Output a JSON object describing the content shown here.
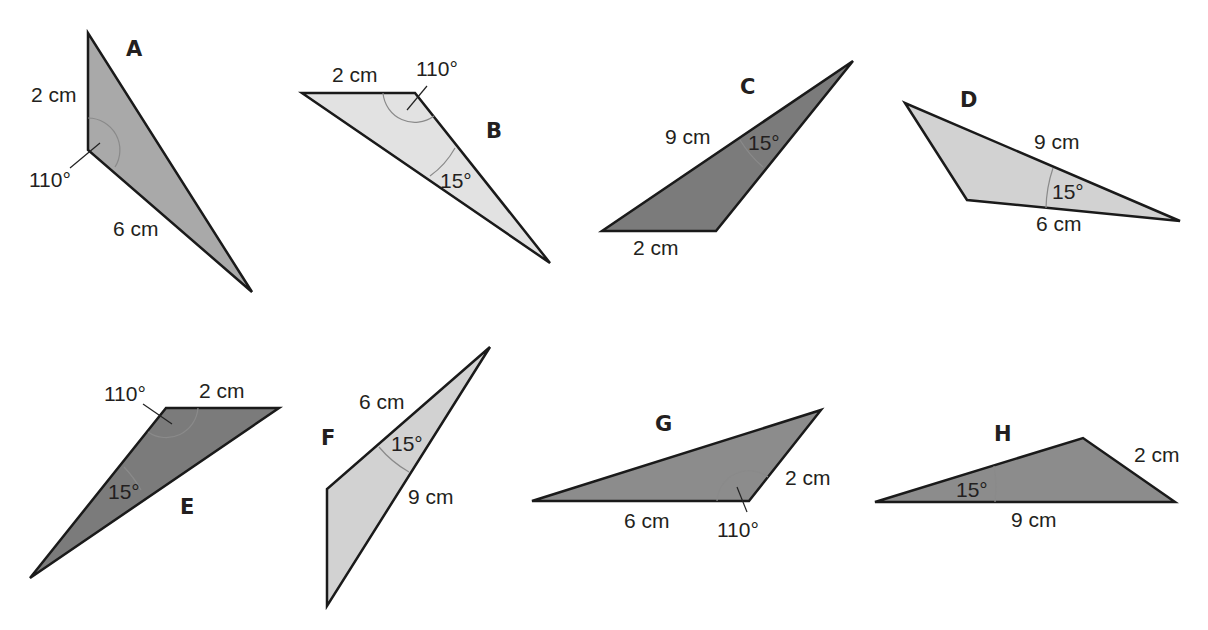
{
  "colors": {
    "stroke": "#1a1a1a",
    "medium_gray": "#a9a9a9",
    "light_gray": "#e2e2e2",
    "pale_gray": "#d2d2d2",
    "dark_gray": "#7b7b7b",
    "mid_dark_gray": "#8c8c8c",
    "text": "#231f20"
  },
  "triangles": [
    {
      "name": "A",
      "labels": {
        "side1": "2 cm",
        "side2": "6 cm",
        "angle": "110°"
      }
    },
    {
      "name": "B",
      "labels": {
        "side1": "2 cm",
        "angle1": "110°",
        "angle2": "15°"
      }
    },
    {
      "name": "C",
      "labels": {
        "side1": "9 cm",
        "side2": "2 cm",
        "angle": "15°"
      }
    },
    {
      "name": "D",
      "labels": {
        "side1": "9 cm",
        "side2": "6 cm",
        "angle": "15°"
      }
    },
    {
      "name": "E",
      "labels": {
        "side1": "2 cm",
        "angle1": "110°",
        "angle2": "15°"
      }
    },
    {
      "name": "F",
      "labels": {
        "side1": "6 cm",
        "side2": "9 cm",
        "angle": "15°"
      }
    },
    {
      "name": "G",
      "labels": {
        "side1": "6 cm",
        "side2": "2 cm",
        "angle": "110°"
      }
    },
    {
      "name": "H",
      "labels": {
        "side1": "2 cm",
        "side2": "9 cm",
        "angle": "15°"
      }
    }
  ]
}
